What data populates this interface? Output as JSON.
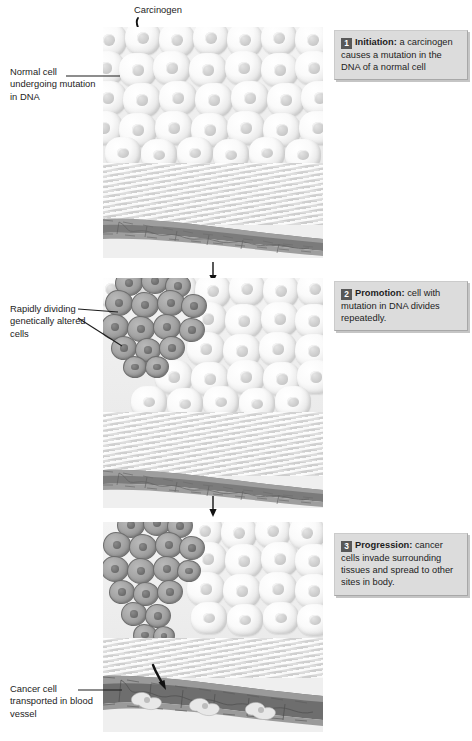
{
  "figure": {
    "panel_count": 3
  },
  "annotations": {
    "carcinogen": "Carcinogen",
    "normal_cell": "Normal cell undergoing mutation in DNA",
    "rapid_cells": "Rapidly dividing genetically altered cells",
    "cancer_cell": "Cancer cell transported in blood vessel"
  },
  "steps": [
    {
      "number": "1",
      "term": "Initiation:",
      "text": " a carcinogen causes a mutation in the DNA of a normal cell"
    },
    {
      "number": "2",
      "term": "Promotion:",
      "text": " cell with mutation in DNA divides repeatedly."
    },
    {
      "number": "3",
      "term": "Progression:",
      "text": " cancer cells invade surrounding tissues and spread to other sites in body."
    }
  ],
  "icons": {
    "carcinogen_arrow": "squiggle-arrow-icon",
    "step_arrow": "down-arrow-icon",
    "invasion_arrow": "invasion-arrow-icon"
  },
  "colors": {
    "caption_background": "#dcdcdc",
    "badge_background": "#585858",
    "badge_text": "#ffffff",
    "panel_background": "#efefef",
    "tumor_cell": "#a6a6a6",
    "vessel_dark": "#6e6e6e",
    "text": "#1d1d1d"
  }
}
